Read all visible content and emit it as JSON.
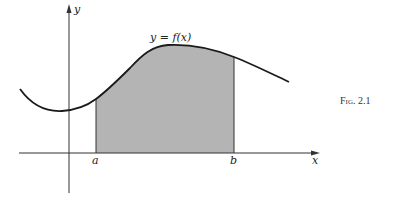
{
  "figure": {
    "caption": "Fig. 2.1",
    "curve_label": "y = f(x)",
    "x_axis_label": "x",
    "y_axis_label": "y",
    "a_label": "a",
    "b_label": "b",
    "colors": {
      "line": "#1a1a1a",
      "axis": "#333333",
      "shade": "#b4b4b4"
    }
  }
}
